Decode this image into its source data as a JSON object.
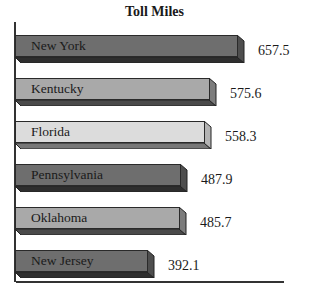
{
  "chart_data": {
    "type": "bar",
    "orientation": "horizontal",
    "title": "Toll Miles",
    "xlabel": "",
    "ylabel": "",
    "categories": [
      "New York",
      "Kentucky",
      "Florida",
      "Pennsylvania",
      "Oklahoma",
      "New Jersey"
    ],
    "values": [
      657.5,
      575.6,
      558.3,
      487.9,
      485.7,
      392.1
    ],
    "bar_colors": [
      "#6e6e6e",
      "#a9a9a9",
      "#dcdcdc",
      "#6e6e6e",
      "#a9a9a9",
      "#6e6e6e"
    ],
    "grid": false,
    "legend": null,
    "style": "3d-bars-with-inside-labels"
  },
  "title": "Toll Miles",
  "bars": [
    {
      "label": "New York",
      "value": "657.5"
    },
    {
      "label": "Kentucky",
      "value": "575.6"
    },
    {
      "label": "Florida",
      "value": "558.3"
    },
    {
      "label": "Pennsylvania",
      "value": "487.9"
    },
    {
      "label": "Oklahoma",
      "value": "485.7"
    },
    {
      "label": "New Jersey",
      "value": "392.1"
    }
  ]
}
